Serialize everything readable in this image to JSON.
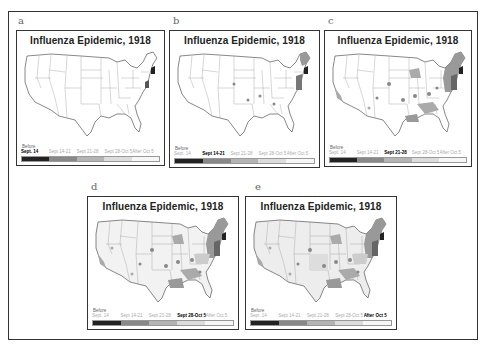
{
  "figure": {
    "panels": [
      {
        "label": "a",
        "title": "Influenza Epidemic, 1918",
        "active_index": 0
      },
      {
        "label": "b",
        "title": "Influenza Epidemic, 1918",
        "active_index": 1
      },
      {
        "label": "c",
        "title": "Influenza Epidemic, 1918",
        "active_index": 2
      },
      {
        "label": "d",
        "title": "Influenza Epidemic, 1918",
        "active_index": 3
      },
      {
        "label": "e",
        "title": "Influenza Epidemic, 1918",
        "active_index": 4
      }
    ],
    "legend": {
      "before_label": "Before",
      "periods": [
        "Sept. 14",
        "Sept 14-21",
        "Sept 21-28",
        "Sept 28-Oct 5",
        "After Oct 5"
      ],
      "colors": [
        "#222222",
        "#888888",
        "#b4b4b4",
        "#dcdcdc",
        "#f6f6f6"
      ]
    }
  }
}
